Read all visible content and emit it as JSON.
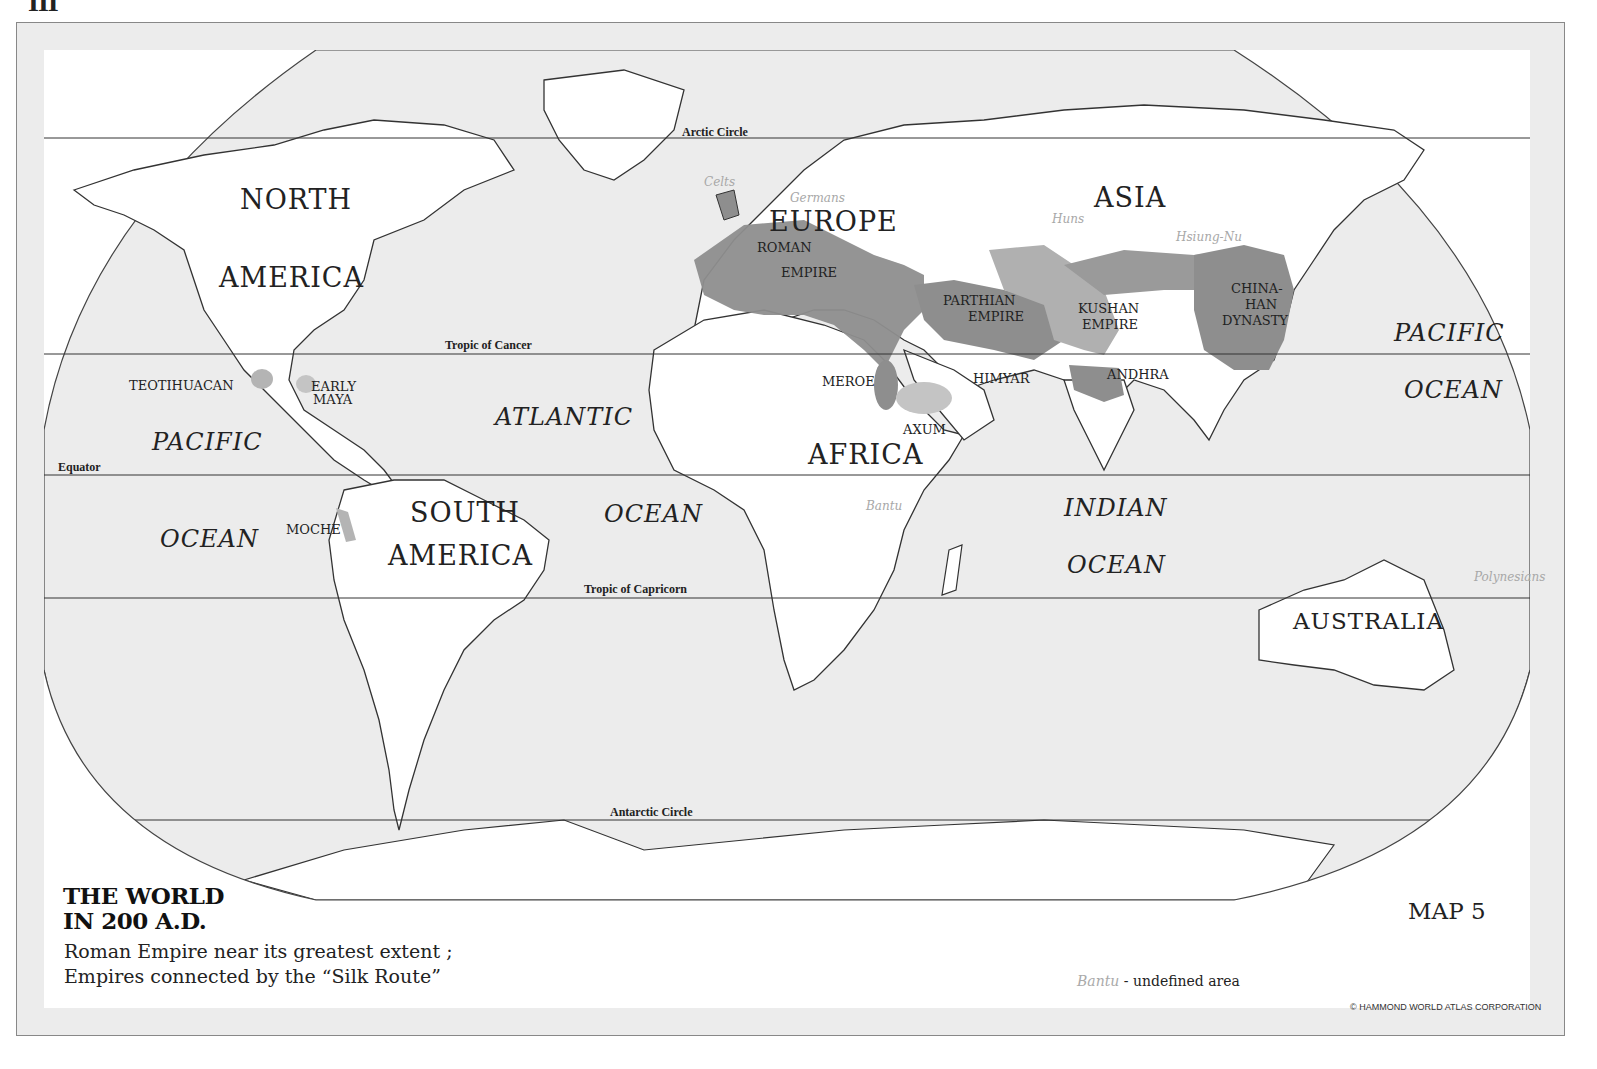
{
  "page": {
    "mark": "III"
  },
  "map": {
    "title_line1": "THE WORLD",
    "title_line2": "IN 200 A.D.",
    "subtitle_line1": "Roman Empire near its greatest extent ;",
    "subtitle_line2": "Empires connected by the “Silk Route”",
    "map_number": "MAP 5",
    "legend": {
      "sample": "Bantu",
      "text": " - undefined area"
    },
    "copyright": "© HAMMOND WORLD ATLAS CORPORATION"
  },
  "latitude_lines": {
    "arctic": "Arctic Circle",
    "cancer": "Tropic of Cancer",
    "equator": "Equator",
    "capricorn": "Tropic of Capricorn",
    "antarctic": "Antarctic Circle"
  },
  "continents": {
    "north_america_1": "NORTH",
    "north_america_2": "AMERICA",
    "south_america_1": "SOUTH",
    "south_america_2": "AMERICA",
    "europe": "EUROPE",
    "asia": "ASIA",
    "africa": "AFRICA",
    "australia": "AUSTRALIA"
  },
  "oceans": {
    "pacific_west_1": "PACIFIC",
    "pacific_west_2": "OCEAN",
    "atlantic_1": "ATLANTIC",
    "atlantic_2": "OCEAN",
    "indian_1": "INDIAN",
    "indian_2": "OCEAN",
    "pacific_east_1": "PACIFIC",
    "pacific_east_2": "OCEAN"
  },
  "empires": {
    "roman_1": "ROMAN",
    "roman_2": "EMPIRE",
    "parthian_1": "PARTHIAN",
    "parthian_2": "EMPIRE",
    "kushan_1": "KUSHAN",
    "kushan_2": "EMPIRE",
    "china_1": "CHINA-",
    "china_2": "HAN",
    "china_3": "DYNASTY",
    "teotihuacan": "TEOTIHUACAN",
    "maya_1": "EARLY",
    "maya_2": "MAYA",
    "moche": "MOCHE",
    "meroe": "MEROE",
    "axum": "AXUM",
    "himyar": "HIMYAR",
    "andhra": "ANDHRA"
  },
  "peoples": {
    "celts": "Celts",
    "germans": "Germans",
    "huns": "Huns",
    "hsiung_nu": "Hsiung-Nu",
    "bantu": "Bantu",
    "polynesians": "Polynesians"
  },
  "colors": {
    "sea": "#ececec",
    "land": "#ffffff",
    "empire_dark": "#8e8e8e",
    "empire_mid": "#a9a9a9",
    "empire_light": "#c4c4c4",
    "people_text": "#a8a8a8"
  }
}
